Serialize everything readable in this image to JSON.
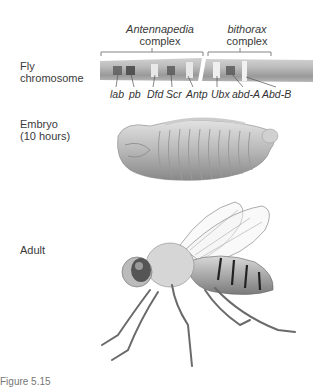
{
  "rows": {
    "chromosome": {
      "label_line1": "Fly",
      "label_line2": "chromosome"
    },
    "embryo": {
      "label_line1": "Embryo",
      "label_line2": "(10 hours)"
    },
    "adult": {
      "label": "Adult"
    }
  },
  "complexes": [
    {
      "name": "Antennapedia",
      "suffix": "complex"
    },
    {
      "name": "bithorax",
      "suffix": "complex"
    }
  ],
  "genes": [
    "lab",
    "pb",
    "Dfd",
    "Scr",
    "Antp",
    "Ubx",
    "abd-A",
    "Abd-B"
  ],
  "caption": "Figure 5.15",
  "colors": {
    "chromosome": "#a9a9a9",
    "band_dark": "#555555",
    "band_light": "#e6e6e6",
    "text": "#3a3a3a"
  }
}
